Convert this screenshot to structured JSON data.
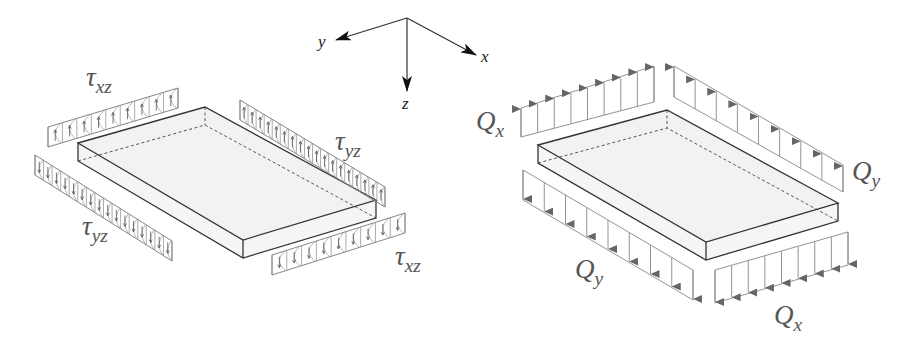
{
  "figure": {
    "axes": {
      "x_label": "x",
      "y_label": "y",
      "z_label": "z"
    },
    "left_panel": {
      "title": "shear stresses on plate edges",
      "labels": {
        "tau_xz_top": {
          "symbol": "τ",
          "sub": "xz"
        },
        "tau_yz_right": {
          "symbol": "τ",
          "sub": "yz"
        },
        "tau_yz_left": {
          "symbol": "τ",
          "sub": "yz"
        },
        "tau_xz_bottom": {
          "symbol": "τ",
          "sub": "xz"
        }
      }
    },
    "right_panel": {
      "title": "shear force resultants on plate edges",
      "labels": {
        "q_x_top": {
          "symbol": "Q",
          "sub": "x"
        },
        "q_y_right": {
          "symbol": "Q",
          "sub": "y"
        },
        "q_y_left": {
          "symbol": "Q",
          "sub": "y"
        },
        "q_x_bottom": {
          "symbol": "Q",
          "sub": "x"
        }
      }
    },
    "colors": {
      "slab_fill": "#f1f1f1",
      "slab_edge": "#333333",
      "load_line": "#888888",
      "arrow_head": "#666666",
      "label_text": "#555555"
    }
  }
}
